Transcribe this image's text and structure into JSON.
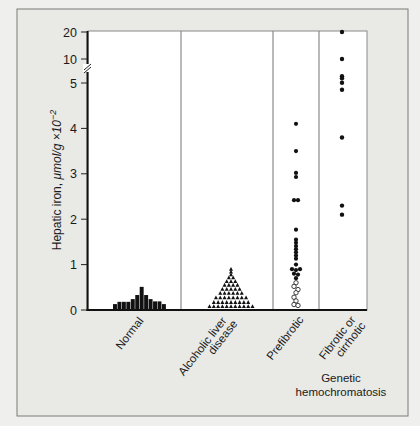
{
  "chart_data": {
    "type": "scatter",
    "title": "",
    "ylabel": {
      "plain": "Hepatic iron, ",
      "italic": "μmol/g ×10",
      "superscript": "−2"
    },
    "xlabel": "",
    "y_axis": {
      "scale": "linear 0–5 with axis break above 5 (compressed 5–20)",
      "ticks": [
        0,
        1,
        2,
        3,
        4,
        5,
        10,
        20
      ],
      "tick_labels": [
        "0",
        "1",
        "2",
        "3",
        "4",
        "5",
        "10",
        "20"
      ],
      "ylim": [
        0,
        20
      ],
      "break_between": [
        5,
        10
      ]
    },
    "grid": false,
    "categories": [
      "Normal",
      "Alcoholic liver disease",
      "Prefibrotic",
      "Fibrotic or cirrhotic"
    ],
    "category_labels": [
      {
        "lines": [
          "Normal"
        ]
      },
      {
        "lines": [
          "Alcoholic liver",
          "disease"
        ]
      },
      {
        "lines": [
          "Prefibrotic"
        ]
      },
      {
        "lines": [
          "Fibrotic or",
          "cirrhotic"
        ]
      }
    ],
    "group_label": {
      "lines": [
        "Genetic",
        "hemochromatosis"
      ],
      "spans_categories": [
        "Prefibrotic",
        "Fibrotic or cirrhotic"
      ]
    },
    "series": [
      {
        "name": "Normal",
        "style": "histogram",
        "bar_heights": [
          0.13,
          0.18,
          0.18,
          0.18,
          0.24,
          0.33,
          0.51,
          0.33,
          0.24,
          0.19,
          0.19,
          0.13
        ]
      },
      {
        "name": "Alcoholic liver disease",
        "style": "triangle-dot-histogram",
        "rows": [
          {
            "value": 0.08,
            "count": 11
          },
          {
            "value": 0.17,
            "count": 9
          },
          {
            "value": 0.27,
            "count": 8
          },
          {
            "value": 0.37,
            "count": 6
          },
          {
            "value": 0.46,
            "count": 5
          },
          {
            "value": 0.55,
            "count": 4
          },
          {
            "value": 0.63,
            "count": 3
          },
          {
            "value": 0.71,
            "count": 2
          },
          {
            "value": 0.78,
            "count": 1
          },
          {
            "value": 0.84,
            "count": 1
          },
          {
            "value": 0.9,
            "count": 1
          }
        ]
      },
      {
        "name": "Prefibrotic",
        "style": "dots",
        "points_filled": [
          4.1,
          3.5,
          3.02,
          2.93,
          2.42,
          2.42,
          1.77,
          1.55,
          1.48,
          1.41,
          1.34,
          1.27,
          1.2,
          1.13,
          1.0,
          0.9,
          0.88,
          0.9,
          0.8,
          0.78,
          0.7
        ],
        "points_filled_dx": [
          0,
          0,
          0,
          0,
          -2,
          2,
          0,
          0,
          0,
          0,
          0,
          0,
          0,
          0,
          0,
          -4,
          0,
          4,
          -2,
          2,
          0
        ],
        "points_open": [
          0.6,
          0.52,
          0.45,
          0.38,
          0.28,
          0.2,
          0.12,
          0.1
        ],
        "points_open_dx": [
          0,
          -2,
          2,
          0,
          -2,
          0,
          -2,
          2
        ]
      },
      {
        "name": "Fibrotic or cirrhotic",
        "style": "dots",
        "points_filled": [
          20,
          10,
          6.4,
          6.0,
          5.05,
          4.85,
          3.8,
          2.3,
          2.1
        ],
        "points_filled_dx": [
          0,
          0,
          0,
          0,
          0,
          0,
          0,
          0,
          0
        ]
      }
    ],
    "colors": {
      "background": "#efefed",
      "panel": "#e9e9e6",
      "plot": "#ffffff",
      "markers": "#111111",
      "axis": "#111111",
      "dividers": "#8a8a8a"
    }
  }
}
